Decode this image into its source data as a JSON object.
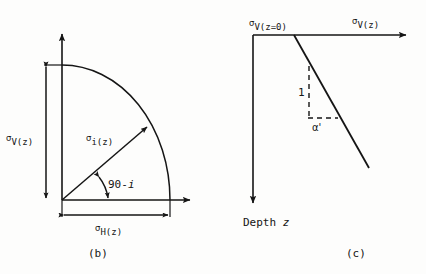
{
  "figure": {
    "background_color": "#fdfdfc",
    "ink_color": "#151515",
    "panel_b": {
      "subfigure_label": "(b)",
      "vertical_stress_label": {
        "symbol": "σ",
        "subscript": "V(z)",
        "full": "σV(z)"
      },
      "inclined_stress_label": {
        "symbol": "σ",
        "subscript": "i(z)",
        "full": "σi(z)"
      },
      "horizontal_stress_label": {
        "symbol": "σ",
        "subscript": "H(z)",
        "full": "σH(z)"
      },
      "angle_label": "90-i",
      "angle_label_prefix": "90-",
      "angle_label_variable": "i"
    },
    "panel_c": {
      "subfigure_label": "(c)",
      "surface_stress_label": {
        "symbol": "σ",
        "subscript": "V(z=0)",
        "full": "σV(z=0)"
      },
      "axis_stress_label": {
        "symbol": "σ",
        "subscript": "V(z)",
        "full": "σV(z)"
      },
      "slope_rise_label": "1",
      "slope_angle_label": "α'",
      "depth_axis_label_prefix": "Depth ",
      "depth_axis_label_variable": "z",
      "depth_axis_label": "Depth z"
    }
  }
}
